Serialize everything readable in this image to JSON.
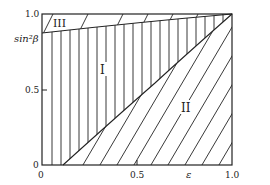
{
  "figure": {
    "type": "phase-diagram",
    "xlabel": "ε",
    "ylabel": "sin²β",
    "x_ticks": [
      "0",
      "0.5",
      "1.0"
    ],
    "y_ticks": [
      "0",
      "0.5",
      "1.0"
    ],
    "regions": [
      {
        "id": "I",
        "label": "I",
        "hatch": "vertical"
      },
      {
        "id": "II",
        "label": "II",
        "hatch": "diagonal"
      },
      {
        "id": "III",
        "label": "III",
        "hatch": "diagonal"
      }
    ],
    "boundaries": [
      {
        "name": "I-III boundary",
        "from": [
          0,
          0.88
        ],
        "to": [
          1.0,
          1.0
        ]
      },
      {
        "name": "I-II boundary",
        "from": [
          0.1,
          0
        ],
        "to": [
          1.0,
          1.0
        ]
      }
    ],
    "colors": {
      "line": "#222222",
      "background": "#ffffff"
    }
  }
}
